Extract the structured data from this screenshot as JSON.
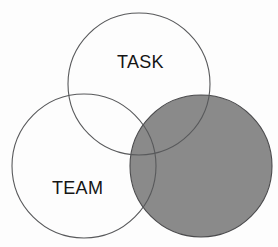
{
  "diagram": {
    "type": "venn",
    "background_color": "#fdfdfd",
    "outline_color": "#58595b",
    "label_color": "#151515",
    "circles": [
      {
        "id": "task",
        "label": "TASK",
        "fill": "none",
        "fill_color": "#ffffff",
        "stroke_color": "#58595b",
        "center_x": 139,
        "center_y": 84,
        "radius": 71
      },
      {
        "id": "team",
        "label": "TEAM",
        "fill": "none",
        "fill_color": "#ffffff",
        "stroke_color": "#58595b",
        "center_x": 84,
        "center_y": 166,
        "radius": 72
      },
      {
        "id": "shaded",
        "label": "",
        "fill": "solid",
        "fill_color": "#8a8a8a",
        "stroke_color": "#4a4a4c",
        "center_x": 201,
        "center_y": 166,
        "radius": 71
      }
    ],
    "labels": {
      "task": "TASK",
      "team": "TEAM"
    }
  }
}
